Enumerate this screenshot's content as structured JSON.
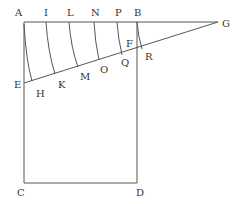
{
  "diagram": {
    "colors": {
      "line": "#555555",
      "label": "#333333",
      "background": "#ffffff"
    },
    "labels": {
      "A": "A",
      "I": "I",
      "L": "L",
      "N": "N",
      "P": "P",
      "B": "B",
      "G": "G",
      "F": "F",
      "E": "E",
      "H": "H",
      "K": "K",
      "M": "M",
      "O": "O",
      "Q": "Q",
      "R": "R",
      "C": "C",
      "D": "D"
    }
  }
}
